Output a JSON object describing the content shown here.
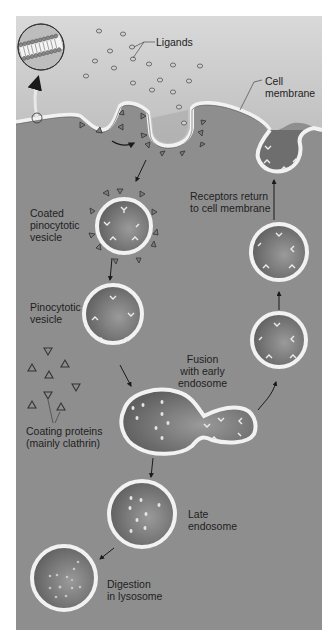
{
  "figure": {
    "colors": {
      "frame_bg_top": "#d8d8d8",
      "frame_bg_bottom": "#9a9a9a",
      "cytoplasm": "#8c8c8c",
      "membrane": "#f2f2f2",
      "membrane_edge": "#555555",
      "vesicle_inner": "#6e6e6e",
      "arrow": "#1a1a1a",
      "text": "#1e1e1e"
    }
  },
  "labels": {
    "ligands": "Ligands",
    "cell_membrane": "Cell\nmembrane",
    "coated_vesicle": "Coated\npinocytotic\nvesicle",
    "receptors_return": "Receptors return\nto cell membrane",
    "pinocytotic_vesicle": "Pinocytotic\nvesicle",
    "fusion": "Fusion\nwith early\nendosome",
    "coating_proteins": "Coating proteins\n(mainly clathrin)",
    "late_endosome": "Late\nendosome",
    "digestion": "Digestion\nin lysosome"
  }
}
